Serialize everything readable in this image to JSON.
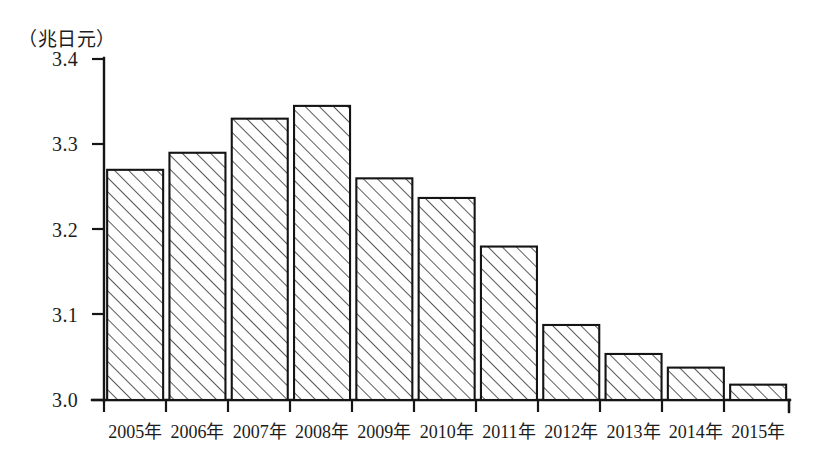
{
  "chart_data": {
    "type": "bar",
    "title": "",
    "subtitle": "",
    "unit_caption": "（兆日元）",
    "xlabel": "",
    "ylabel": "",
    "ylim": [
      3.0,
      3.4
    ],
    "ytick_labels": [
      "3.4",
      "3.3",
      "3.2",
      "3.1",
      "3.0"
    ],
    "ytick_values": [
      3.4,
      3.3,
      3.2,
      3.1,
      3.0
    ],
    "grid": false,
    "legend": false,
    "legend_position": "none",
    "bar_fill": "diagonal-hatch",
    "bar_edge_color": "#141414",
    "axis_color": "#151515",
    "background_color": "#ffffff",
    "categories": [
      "2005年",
      "2006年",
      "2007年",
      "2008年",
      "2009年",
      "2010年",
      "2011年",
      "2012年",
      "2013年",
      "2014年",
      "2015年"
    ],
    "values": [
      3.27,
      3.29,
      3.33,
      3.345,
      3.26,
      3.237,
      3.18,
      3.088,
      3.054,
      3.038,
      3.018
    ],
    "series": [
      {
        "name": "",
        "values": [
          3.27,
          3.29,
          3.33,
          3.345,
          3.26,
          3.237,
          3.18,
          3.088,
          3.054,
          3.038,
          3.018
        ]
      }
    ],
    "annotations": []
  },
  "axis": {
    "unit": "（兆日元）"
  }
}
